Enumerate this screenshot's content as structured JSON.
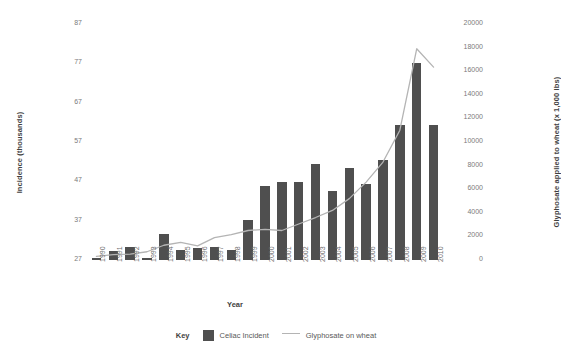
{
  "chart_data": {
    "type": "bar",
    "title": "",
    "xlabel": "Year",
    "ylabel": "Incidence (thousands)",
    "y2label": "Glyphosate applied to wheat (x 1,000 lbs)",
    "categories": [
      "1990",
      "1991",
      "1992",
      "1993",
      "1994",
      "1995",
      "1996",
      "1997",
      "1998",
      "1999",
      "2000",
      "2001",
      "2002",
      "2003",
      "2004",
      "2005",
      "2006",
      "2007",
      "2008",
      "2009",
      "2010"
    ],
    "ylim": [
      27,
      87
    ],
    "yticks": [
      27,
      37,
      47,
      57,
      67,
      77,
      87
    ],
    "y2lim": [
      0,
      20000
    ],
    "y2ticks": [
      0,
      2000,
      4000,
      6000,
      8000,
      10000,
      12000,
      14000,
      16000,
      18000,
      20000
    ],
    "grid": false,
    "legend_position": "bottom",
    "series": [
      {
        "name": "Celiac Incident",
        "type": "bar",
        "axis": "left",
        "color": "#4f4f4f",
        "values": [
          27.4,
          29.4,
          30.3,
          27.6,
          33.7,
          29.5,
          30.1,
          30.2,
          29.6,
          37.1,
          45.8,
          46.8,
          46.8,
          51.4,
          44.6,
          50.3,
          46.4,
          52.4,
          61.3,
          77.1,
          61.3
        ]
      },
      {
        "name": "Glyphosate on wheat",
        "type": "line",
        "axis": "right",
        "color": "#b4b4b4",
        "values": [
          300,
          450,
          500,
          700,
          1250,
          1500,
          1200,
          1900,
          2150,
          2500,
          2600,
          2500,
          3050,
          3600,
          4200,
          5200,
          6600,
          8300,
          11000,
          17900,
          16350
        ]
      }
    ]
  },
  "legend": {
    "key_label": "Key",
    "items": [
      {
        "label": "Celiac Incident",
        "marker": "bar-swatch"
      },
      {
        "label": "Glyphosate on wheat",
        "marker": "line-swatch"
      }
    ]
  }
}
